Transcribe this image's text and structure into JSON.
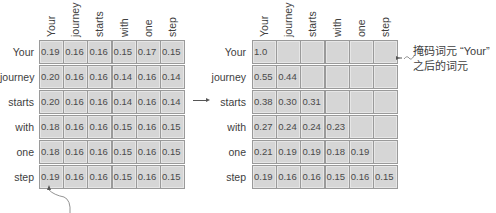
{
  "diagram": {
    "left_matrix": {
      "title": "attention weights (unmasked)",
      "columns": [
        "Your",
        "journey",
        "starts",
        "with",
        "one",
        "step"
      ],
      "rows": [
        {
          "label": "Your",
          "values": [
            "0.19",
            "0.16",
            "0.16",
            "0.15",
            "0.17",
            "0.15"
          ]
        },
        {
          "label": "journey",
          "values": [
            "0.20",
            "0.16",
            "0.16",
            "0.14",
            "0.16",
            "0.14"
          ]
        },
        {
          "label": "starts",
          "values": [
            "0.20",
            "0.16",
            "0.16",
            "0.14",
            "0.16",
            "0.14"
          ]
        },
        {
          "label": "with",
          "values": [
            "0.18",
            "0.16",
            "0.16",
            "0.15",
            "0.16",
            "0.15"
          ]
        },
        {
          "label": "one",
          "values": [
            "0.18",
            "0.16",
            "0.16",
            "0.15",
            "0.16",
            "0.15"
          ]
        },
        {
          "label": "step",
          "values": [
            "0.19",
            "0.16",
            "0.16",
            "0.15",
            "0.16",
            "0.15"
          ]
        }
      ]
    },
    "right_matrix": {
      "columns": [
        "Your",
        "journey",
        "starts",
        "with",
        "one",
        "step"
      ],
      "rows": [
        {
          "label": "Your",
          "values": [
            "1.0",
            "",
            "",
            "",
            "",
            ""
          ]
        },
        {
          "label": "journey",
          "values": [
            "0.55",
            "0.44",
            "",
            "",
            "",
            ""
          ]
        },
        {
          "label": "starts",
          "values": [
            "0.38",
            "0.30",
            "0.31",
            "",
            "",
            ""
          ]
        },
        {
          "label": "with",
          "values": [
            "0.27",
            "0.24",
            "0.24",
            "0.23",
            "",
            ""
          ]
        },
        {
          "label": "one",
          "values": [
            "0.21",
            "0.19",
            "0.19",
            "0.18",
            "0.19",
            ""
          ]
        },
        {
          "label": "step",
          "values": [
            "0.19",
            "0.16",
            "0.16",
            "0.15",
            "0.16",
            "0.15"
          ]
        }
      ]
    },
    "annotation": {
      "line1": "掩码词元 “Your”",
      "line2": "之后的词元"
    },
    "colors": {
      "cell_fill": "#d6d6d6",
      "cell_border": "#9a9a9a",
      "text": "#404040",
      "arrow": "#555555"
    }
  }
}
